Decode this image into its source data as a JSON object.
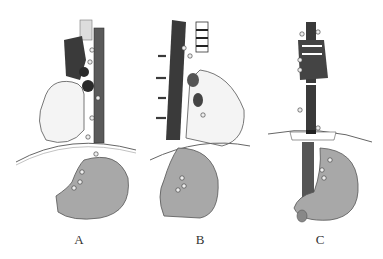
{
  "figure": {
    "panels": [
      {
        "label": "A"
      },
      {
        "label": "B"
      },
      {
        "label": "C"
      }
    ],
    "colors": {
      "organ_gray": "#a8a8a8",
      "vessel_dark": "#3a3a3a",
      "heart_white": "#f4f4f4",
      "outline": "#555555"
    }
  }
}
